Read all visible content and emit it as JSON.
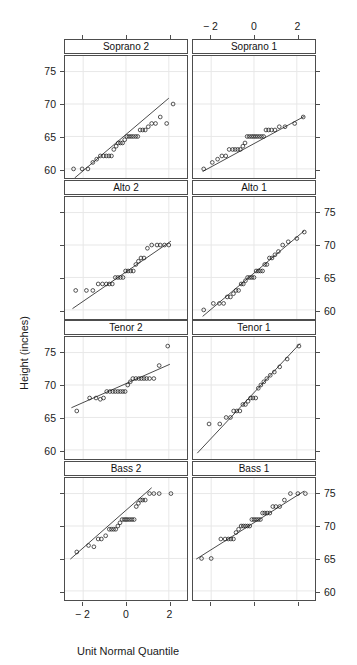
{
  "figure": {
    "x_axis_label": "Unit Normal Quantile",
    "y_axis_label": "Height (inches)",
    "x_ticks": [
      "− 2",
      "0",
      "2"
    ],
    "y_ticks": [
      "60",
      "65",
      "70",
      "75"
    ],
    "grid_color": "#e8e8e8",
    "border_color": "#4d4d4d",
    "point_color": "#1a1a1a",
    "line_color": "#1a1a1a"
  },
  "chart_data": {
    "type": "scatter",
    "title": "",
    "subtitle": "",
    "xlabel": "Unit Normal Quantile",
    "ylabel": "Height (inches)",
    "xlim": [
      -2.85,
      2.85
    ],
    "ylim": [
      58.6,
      77.4
    ],
    "xticks": [
      -2,
      0,
      2
    ],
    "yticks": [
      60,
      65,
      70,
      75
    ],
    "grid": true,
    "legend": "none",
    "layout": {
      "rows": 4,
      "cols": 2,
      "panel_order": [
        "Soprano 2",
        "Soprano 1",
        "Alto 2",
        "Alto 1",
        "Tenor 2",
        "Tenor 1",
        "Bass 2",
        "Bass 1"
      ]
    },
    "annotation": "Normal quantile-quantile plots of singer heights by voice part, with reference lines.",
    "panels": [
      {
        "name": "Soprano 2",
        "row": 0,
        "col": 0,
        "xtick_side": "bottom-shared",
        "ytick_side": "left",
        "refline": {
          "x1": -2.4,
          "y1": 58.6,
          "x2": 2.0,
          "y2": 70.9
        },
        "x": [
          -2.45,
          -2.05,
          -1.78,
          -1.55,
          -1.37,
          -1.2,
          -1.05,
          -0.92,
          -0.8,
          -0.68,
          -0.57,
          -0.46,
          -0.36,
          -0.26,
          -0.16,
          -0.06,
          0.04,
          0.14,
          0.24,
          0.34,
          0.45,
          0.55,
          0.66,
          0.78,
          0.9,
          1.04,
          1.2,
          1.38,
          1.6,
          1.9,
          2.2
        ],
        "y": [
          60.0,
          60.0,
          60.0,
          61.0,
          61.5,
          62.0,
          62.0,
          62.0,
          62.0,
          62.0,
          63.0,
          63.5,
          64.0,
          64.0,
          64.0,
          64.5,
          65.0,
          65.0,
          65.0,
          65.0,
          65.0,
          65.0,
          66.0,
          66.0,
          66.0,
          66.5,
          67.0,
          67.0,
          68.0,
          67.0,
          70.0
        ]
      },
      {
        "name": "Soprano 1",
        "row": 0,
        "col": 1,
        "xtick_side": "top",
        "ytick_side": "right-none",
        "refline": {
          "x1": -2.4,
          "y1": 59.6,
          "x2": 2.35,
          "y2": 68.1
        },
        "x": [
          -2.35,
          -1.95,
          -1.7,
          -1.5,
          -1.32,
          -1.16,
          -1.0,
          -0.88,
          -0.76,
          -0.64,
          -0.52,
          -0.42,
          -0.32,
          -0.22,
          -0.12,
          -0.03,
          0.06,
          0.15,
          0.25,
          0.35,
          0.45,
          0.56,
          0.68,
          0.82,
          0.98,
          1.18,
          1.45,
          1.9,
          2.3
        ],
        "y": [
          60.0,
          61.0,
          61.5,
          62.0,
          62.0,
          63.0,
          63.0,
          63.0,
          63.0,
          63.0,
          63.5,
          64.0,
          65.0,
          65.0,
          65.0,
          65.0,
          65.0,
          65.0,
          65.0,
          65.0,
          65.0,
          66.0,
          66.0,
          66.0,
          66.0,
          66.5,
          66.5,
          67.0,
          68.0
        ]
      },
      {
        "name": "Alto 2",
        "row": 1,
        "col": 0,
        "xtick_side": "none",
        "ytick_side": "left-none",
        "refline": {
          "x1": -2.5,
          "y1": 60.2,
          "x2": 2.1,
          "y2": 70.6
        },
        "x": [
          -2.35,
          -1.85,
          -1.55,
          -1.3,
          -1.1,
          -0.92,
          -0.78,
          -0.64,
          -0.5,
          -0.38,
          -0.26,
          -0.14,
          -0.02,
          0.1,
          0.22,
          0.34,
          0.46,
          0.58,
          0.7,
          0.84,
          1.0,
          1.2,
          1.45,
          1.6,
          1.8,
          2.0
        ],
        "y": [
          63.0,
          63.0,
          63.0,
          64.0,
          64.0,
          64.0,
          64.0,
          64.0,
          65.0,
          65.0,
          65.0,
          65.0,
          66.0,
          66.0,
          66.0,
          66.0,
          67.0,
          67.5,
          68.0,
          68.0,
          69.5,
          70.0,
          70.0,
          70.0,
          70.0,
          70.0
        ]
      },
      {
        "name": "Alto 1",
        "row": 1,
        "col": 1,
        "xtick_side": "none",
        "ytick_side": "right",
        "refline": {
          "x1": -2.4,
          "y1": 59.0,
          "x2": 2.35,
          "y2": 72.2
        },
        "x": [
          -2.35,
          -1.9,
          -1.62,
          -1.42,
          -1.25,
          -1.1,
          -0.96,
          -0.84,
          -0.72,
          -0.6,
          -0.5,
          -0.4,
          -0.3,
          -0.2,
          -0.1,
          0.0,
          0.1,
          0.2,
          0.3,
          0.4,
          0.5,
          0.6,
          0.72,
          0.84,
          0.98,
          1.14,
          1.34,
          1.6,
          2.0,
          2.35
        ],
        "y": [
          60.0,
          61.0,
          61.0,
          61.0,
          62.0,
          62.0,
          62.5,
          63.0,
          63.0,
          64.0,
          64.0,
          64.5,
          65.0,
          65.0,
          65.0,
          65.0,
          66.0,
          66.0,
          66.0,
          66.0,
          67.0,
          67.0,
          68.0,
          68.0,
          68.5,
          69.0,
          70.0,
          70.5,
          71.0,
          72.0
        ]
      },
      {
        "name": "Tenor 2",
        "row": 2,
        "col": 0,
        "xtick_side": "none",
        "ytick_side": "left",
        "refline": {
          "x1": -2.55,
          "y1": 66.5,
          "x2": 2.05,
          "y2": 73.2
        },
        "x": [
          -2.3,
          -1.7,
          -1.4,
          -1.2,
          -1.05,
          -0.9,
          -0.75,
          -0.62,
          -0.5,
          -0.38,
          -0.26,
          -0.15,
          -0.04,
          0.08,
          0.2,
          0.32,
          0.46,
          0.6,
          0.72,
          0.84,
          0.96,
          1.1,
          1.3,
          1.55,
          1.95
        ],
        "y": [
          66.0,
          68.0,
          68.0,
          67.8,
          68.0,
          69.0,
          69.0,
          69.0,
          69.0,
          69.0,
          69.0,
          69.0,
          69.0,
          70.0,
          70.5,
          71.0,
          71.0,
          71.0,
          71.0,
          71.0,
          71.0,
          71.0,
          71.0,
          73.0,
          76.0
        ]
      },
      {
        "name": "Tenor 1",
        "row": 2,
        "col": 1,
        "xtick_side": "none",
        "ytick_side": "right-none",
        "refline": {
          "x1": -2.65,
          "y1": 59.5,
          "x2": 2.15,
          "y2": 76.4
        },
        "x": [
          -2.1,
          -1.6,
          -1.3,
          -1.1,
          -0.95,
          -0.8,
          -0.66,
          -0.52,
          -0.4,
          -0.28,
          -0.16,
          -0.05,
          0.08,
          0.2,
          0.32,
          0.46,
          0.6,
          0.76,
          0.95,
          1.2,
          1.55,
          2.1
        ],
        "y": [
          64.0,
          64.0,
          65.0,
          65.0,
          66.0,
          66.0,
          66.0,
          67.0,
          67.0,
          67.5,
          68.0,
          68.0,
          68.0,
          69.5,
          70.0,
          70.5,
          71.0,
          71.5,
          72.0,
          72.8,
          74.0,
          76.0
        ]
      },
      {
        "name": "Bass 2",
        "row": 3,
        "col": 0,
        "xtick_side": "bottom",
        "ytick_side": "left-none",
        "refline": {
          "x1": -2.6,
          "y1": 64.9,
          "x2": 1.2,
          "y2": 75.9
        },
        "x": [
          -2.3,
          -1.75,
          -1.5,
          -1.3,
          -1.15,
          -0.95,
          -0.78,
          -0.68,
          -0.58,
          -0.48,
          -0.38,
          -0.28,
          -0.18,
          -0.08,
          0.0,
          0.08,
          0.18,
          0.28,
          0.38,
          0.48,
          0.58,
          0.68,
          0.78,
          0.9,
          1.1,
          1.3,
          1.55,
          2.1
        ],
        "y": [
          66.0,
          67.0,
          66.8,
          68.0,
          68.0,
          68.5,
          69.5,
          69.5,
          69.5,
          69.5,
          70.0,
          70.5,
          71.0,
          71.0,
          71.0,
          71.0,
          71.0,
          71.0,
          71.0,
          73.0,
          73.5,
          74.0,
          74.0,
          74.0,
          75.0,
          75.0,
          75.0,
          75.0
        ]
      },
      {
        "name": "Bass 1",
        "row": 3,
        "col": 1,
        "xtick_side": "none",
        "ytick_side": "right",
        "refline": {
          "x1": -2.7,
          "y1": 64.9,
          "x2": 2.35,
          "y2": 75.4
        },
        "x": [
          -2.45,
          -2.0,
          -1.55,
          -1.35,
          -1.2,
          -1.08,
          -0.96,
          -0.84,
          -0.72,
          -0.6,
          -0.5,
          -0.4,
          -0.3,
          -0.2,
          -0.1,
          0.0,
          0.1,
          0.2,
          0.3,
          0.4,
          0.5,
          0.62,
          0.74,
          0.88,
          1.02,
          1.2,
          1.42,
          1.7,
          2.05,
          2.4
        ],
        "y": [
          65.0,
          65.0,
          68.0,
          68.0,
          68.0,
          68.0,
          68.0,
          69.0,
          69.5,
          70.0,
          70.0,
          70.0,
          70.0,
          70.0,
          71.0,
          71.0,
          71.0,
          71.0,
          71.0,
          72.0,
          72.0,
          72.0,
          72.0,
          73.0,
          73.0,
          73.0,
          74.0,
          75.0,
          75.0,
          75.0
        ]
      }
    ]
  }
}
